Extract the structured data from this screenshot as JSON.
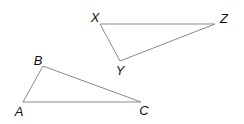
{
  "diagram": {
    "type": "two-triangles",
    "triangles": [
      {
        "name": "XYZ",
        "vertices": [
          {
            "label": "X",
            "x": 100,
            "y": 24,
            "lx": 95,
            "ly": 22
          },
          {
            "label": "Y",
            "x": 120,
            "y": 61,
            "lx": 120,
            "ly": 75
          },
          {
            "label": "Z",
            "x": 215,
            "y": 24,
            "lx": 224,
            "ly": 23
          }
        ]
      },
      {
        "name": "ABC",
        "vertices": [
          {
            "label": "A",
            "x": 23,
            "y": 102,
            "lx": 19,
            "ly": 116
          },
          {
            "label": "B",
            "x": 43,
            "y": 66,
            "lx": 38,
            "ly": 65
          },
          {
            "label": "C",
            "x": 141,
            "y": 102,
            "lx": 144,
            "ly": 115
          }
        ]
      }
    ],
    "colors": {
      "edge": "#8a8a8a",
      "label": "#111111"
    }
  }
}
